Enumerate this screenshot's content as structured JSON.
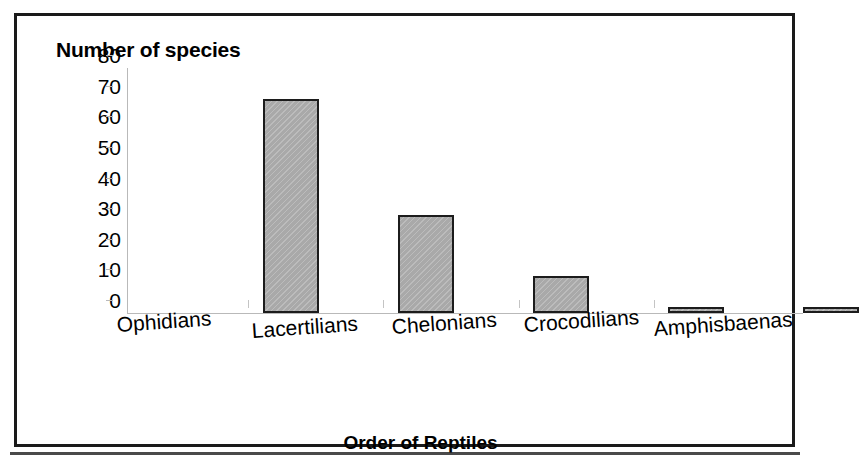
{
  "chart_data": {
    "type": "bar",
    "title": "",
    "xlabel": "Order of Reptiles",
    "ylabel": "Number of species",
    "categories": [
      "Ophidians",
      "Lacertilians",
      "Chelonians",
      "Crocodilians",
      "Amphisbaenas"
    ],
    "values": [
      70,
      32,
      12,
      2,
      2
    ],
    "ylim": [
      0,
      80
    ],
    "yticks": [
      0,
      10,
      20,
      30,
      40,
      50,
      60,
      70,
      80
    ],
    "ytick_labels": [
      "0",
      "10",
      "20",
      "30",
      "40",
      "50",
      "60",
      "70",
      "80"
    ],
    "grid": false,
    "legend": null,
    "bar_fill_color": "#a9a9a9",
    "bar_border_color": "#1c1c1c",
    "axis_color": "#b9b9b9",
    "text_color": "#000000",
    "frame_color": "#1a1a1a",
    "background_color": "#ffffff"
  }
}
